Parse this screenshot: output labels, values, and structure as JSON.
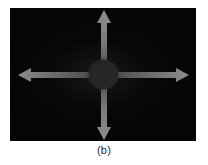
{
  "figure": {
    "caption": "(b)",
    "panel": {
      "background_color": "#050505",
      "width_px": 186,
      "height_px": 133
    },
    "center_object": {
      "name": "central-blob",
      "shape": "circle",
      "color": "#262626",
      "diameter_px": 29
    },
    "arrows": [
      {
        "direction": "up",
        "label": "",
        "color": "#808080",
        "length_px": 52
      },
      {
        "direction": "down",
        "label": "",
        "color": "#808080",
        "length_px": 52
      },
      {
        "direction": "left",
        "label": "",
        "color": "#6e6e6e",
        "length_px": 74
      },
      {
        "direction": "right",
        "label": "",
        "color": "#6e6e6e",
        "length_px": 74
      }
    ]
  },
  "colors": {
    "page_background": "#ffffff",
    "panel_background": "#050505",
    "arrow_gray": "#7a7a7a",
    "blob_gray": "#262626",
    "caption_text": "#2b2b2b"
  }
}
